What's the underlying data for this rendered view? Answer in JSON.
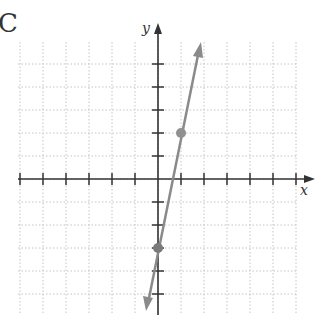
{
  "panel_label": "C",
  "axes": {
    "x_label": "x",
    "y_label": "y"
  },
  "colors": {
    "axis": "#333333",
    "grid": "#bbbbbb",
    "line": "#888888",
    "point": "#888888"
  },
  "chart_data": {
    "type": "line",
    "title": "",
    "xlabel": "x",
    "ylabel": "y",
    "xlim": [
      -6,
      6
    ],
    "ylim": [
      -6,
      6
    ],
    "grid": true,
    "line": {
      "equation": "y = 5x - 3",
      "slope": 5,
      "intercept": -3,
      "arrows": "both"
    },
    "points": [
      {
        "x": 1,
        "y": 2
      },
      {
        "x": 0,
        "y": -3
      }
    ]
  }
}
